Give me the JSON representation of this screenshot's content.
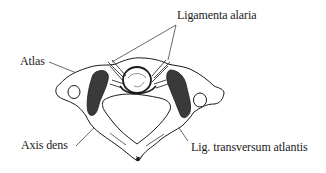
{
  "diagram": {
    "labels": {
      "ligamenta_alaria": "Ligamenta alaria",
      "atlas": "Atlas",
      "axis_dens": "Axis dens",
      "lig_transversum": "Lig. transversum atlantis"
    },
    "colors": {
      "ink": "#1a1a1a",
      "background": "#ffffff",
      "shadow": "#3a3a3a"
    }
  }
}
